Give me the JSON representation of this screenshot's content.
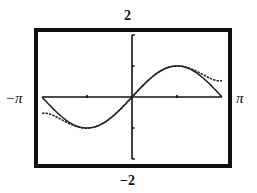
{
  "chart_data": {
    "type": "line",
    "title": "",
    "xlabel": "",
    "ylabel": "",
    "xlim": [
      -3.14159,
      3.14159
    ],
    "ylim": [
      -2,
      2
    ],
    "grid": false,
    "legend": null,
    "window_labels": {
      "xmin": "−π",
      "xmax": "π",
      "ymax": "2",
      "ymin": "−2"
    },
    "x_ticks": [
      -1.5708,
      1.5708
    ],
    "y_ticks": [
      -1,
      1
    ],
    "series": [
      {
        "name": "sin(x)",
        "function": "sin",
        "style": "solid",
        "x": [
          -3.1416,
          -2.3562,
          -1.5708,
          -0.7854,
          0,
          0.7854,
          1.5708,
          2.3562,
          3.1416
        ],
        "values": [
          0,
          -0.707,
          -1,
          -0.707,
          0,
          0.707,
          1,
          0.707,
          0
        ]
      },
      {
        "name": "x - x^3/6 + x^5/120",
        "function": "taylor5",
        "style": "dotted",
        "x": [
          -3.1416,
          -2.3562,
          -1.5708,
          -0.7854,
          0,
          0.7854,
          1.5708,
          2.3562,
          3.1416
        ],
        "values": [
          -0.524,
          -0.714,
          -1.005,
          -0.707,
          0,
          0.707,
          1.005,
          0.714,
          0.524
        ]
      }
    ]
  }
}
